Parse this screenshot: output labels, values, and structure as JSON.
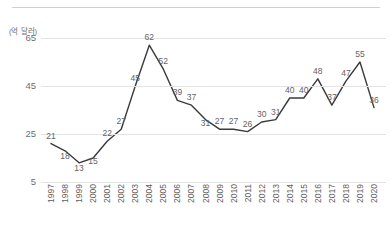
{
  "chart_data": {
    "type": "line",
    "title": "",
    "subtitle": "",
    "xlabel": "",
    "ylabel": "",
    "unit_label": "(억 달러)",
    "categories": [
      "1997",
      "1998",
      "1999",
      "2000",
      "2001",
      "2002",
      "2003",
      "2004",
      "2005",
      "2006",
      "2007",
      "2008",
      "2009",
      "2010",
      "2011",
      "2012",
      "2013",
      "2014",
      "2015",
      "2016",
      "2017",
      "2018",
      "2019",
      "2020"
    ],
    "values": [
      21,
      18,
      13,
      15,
      22,
      27,
      45,
      62,
      52,
      39,
      37,
      31,
      27,
      27,
      26,
      30,
      31,
      40,
      40,
      48,
      37,
      47,
      55,
      36
    ],
    "data_labels": [
      "21",
      "18",
      "13",
      "15",
      "22",
      "27",
      "45",
      "62",
      "52",
      "39",
      "37",
      "31",
      "27",
      "27",
      "26",
      "30",
      "31",
      "40",
      "40",
      "48",
      "37",
      "47",
      "55",
      "36"
    ],
    "yticks": [
      "5",
      "25",
      "45",
      "65"
    ],
    "ytick_values": [
      5,
      25,
      45,
      65
    ],
    "ylim": [
      5,
      65
    ],
    "grid": true,
    "legend": "none",
    "series_color": "#3a3a3a",
    "grid_color": "#e3e3e3",
    "text_color": "#6e6e6e"
  }
}
